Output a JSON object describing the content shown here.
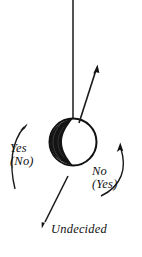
{
  "figure": {
    "type": "pendulum-response-diagram",
    "background_color": "#ffffff",
    "ink_color": "#111111",
    "labels": {
      "left_primary": "Yes",
      "left_secondary": "(No)",
      "right_primary": "No",
      "right_secondary": "(Yes)",
      "bottom": "Undecided"
    },
    "elements": {
      "suspension_line": "vertical-thread",
      "bob": "shaded-sphere",
      "arrow_up_right": "diagonal-swing-arrow",
      "arrow_down_left": "undecided-swing-arrow",
      "arc_left": "counterclockwise-rotation-arc",
      "arc_right": "clockwise-rotation-arc"
    },
    "geometry": {
      "thread_x": 73,
      "thread_top_y": 0,
      "bob_center_x": 73,
      "bob_center_y": 142,
      "bob_radius": 24
    }
  }
}
